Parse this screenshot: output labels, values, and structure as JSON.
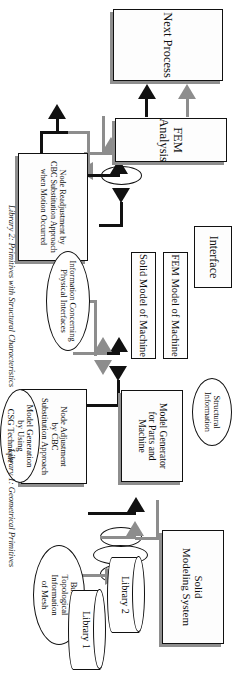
{
  "diagram": {
    "orientation": "rotated-90-clockwise",
    "colors": {
      "stroke": "#111111",
      "shadow": "#8e8e8e",
      "gray_arrow": "#8d8d8d",
      "background": "#ffffff"
    },
    "nodes": [
      {
        "id": "node-readjustment",
        "shape": "box",
        "label": "Node Readjustment  by\nCBC Substitution Approach\nwhen Motion Occurred"
      },
      {
        "id": "fem-analysis",
        "shape": "box",
        "label": "FEM Analysis"
      },
      {
        "id": "next-process",
        "shape": "box",
        "label": "Next Process"
      },
      {
        "id": "interface",
        "shape": "box",
        "label": "Interface"
      },
      {
        "id": "fem-model",
        "shape": "box",
        "label": "FEM Model of Machine"
      },
      {
        "id": "solid-model",
        "shape": "box",
        "label": "Solid Model of Machine"
      },
      {
        "id": "info-physical",
        "shape": "ellipse",
        "label": "Information Concerning\nPhysical Interfaces"
      },
      {
        "id": "structural-info",
        "shape": "ellipse",
        "label": "Structural\nInformation"
      },
      {
        "id": "node-adjustment",
        "shape": "box",
        "label": "Node Adjustment\nby CBC\nSubstitution Approach"
      },
      {
        "id": "model-generator",
        "shape": "box",
        "label": "Model Generator\nfor Parts and\nMachine"
      },
      {
        "id": "model-generation",
        "shape": "ellipse",
        "label": "Model Generation\nby Using\nCSG Technique"
      },
      {
        "id": "builtin-topological",
        "shape": "ellipse",
        "label": "Built-in\nTopological\nInformation\nof Mesh"
      },
      {
        "id": "solid-modeling",
        "shape": "box",
        "label": "Solid\nModeling System"
      },
      {
        "id": "library-1",
        "shape": "cylinder",
        "label": "Library 1"
      },
      {
        "id": "library-2",
        "shape": "cylinder",
        "label": "Library 2"
      }
    ],
    "caption": {
      "library1": "Library 1: Geometrical Primitives",
      "library2": "Library 2: Primitives with Structural Characteristics"
    }
  }
}
